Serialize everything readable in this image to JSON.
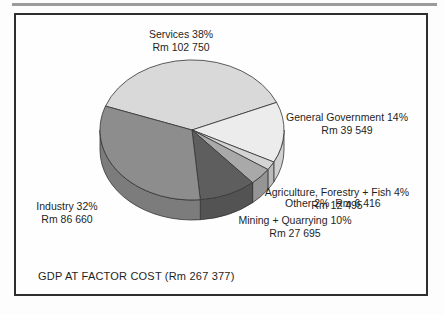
{
  "page": {
    "background": "#fdfdfd"
  },
  "top_rule": {
    "color": "#9b9b9b"
  },
  "frame": {
    "border_color": "#2e2e2e"
  },
  "chart_data": {
    "type": "pie",
    "style": "3d",
    "title": "GDP AT FACTOR COST (Rm 267 377)",
    "unit": "Rm (millions)",
    "total": 267377,
    "currency_prefix": "Rm",
    "start_angle_deg": 160,
    "direction": "clockwise",
    "legend_position": "labels-around-slices",
    "outline_color": "#333333",
    "depth_px": 20,
    "slices": [
      {
        "label": "Services",
        "pct": 38,
        "value": 102750,
        "color": "#d9d9d9"
      },
      {
        "label": "General Government",
        "pct": 14,
        "value": 39549,
        "color": "#ececec"
      },
      {
        "label": "Other",
        "pct": 2,
        "value": 6416,
        "color": "#d4d4d4"
      },
      {
        "label": "Agriculture, Forestry + Fish",
        "pct": 4,
        "value": 12495,
        "color": "#a9a9a9"
      },
      {
        "label": "Mining + Quarrying",
        "pct": 10,
        "value": 27695,
        "color": "#5e5e5e"
      },
      {
        "label": "Industry",
        "pct": 32,
        "value": 86660,
        "color": "#8d8d8d"
      }
    ]
  },
  "annotations": {
    "services": {
      "line1": "Services 38%",
      "line2": "Rm 102 750"
    },
    "general_government": {
      "line1": "General Government 14%",
      "line2": "Rm 39 549"
    },
    "other": {
      "line1": "Other 2%  Rm 6 416"
    },
    "agriculture": {
      "line1": "Agriculture, Forestry + Fish 4%",
      "line2": "Rm 12 495"
    },
    "mining": {
      "line1": "Mining + Quarrying 10%",
      "line2": "Rm 27 695"
    },
    "industry": {
      "line1": "Industry 32%",
      "line2": "Rm 86 660"
    }
  },
  "caption": {
    "text": "GDP AT FACTOR COST (Rm 267 377)"
  }
}
